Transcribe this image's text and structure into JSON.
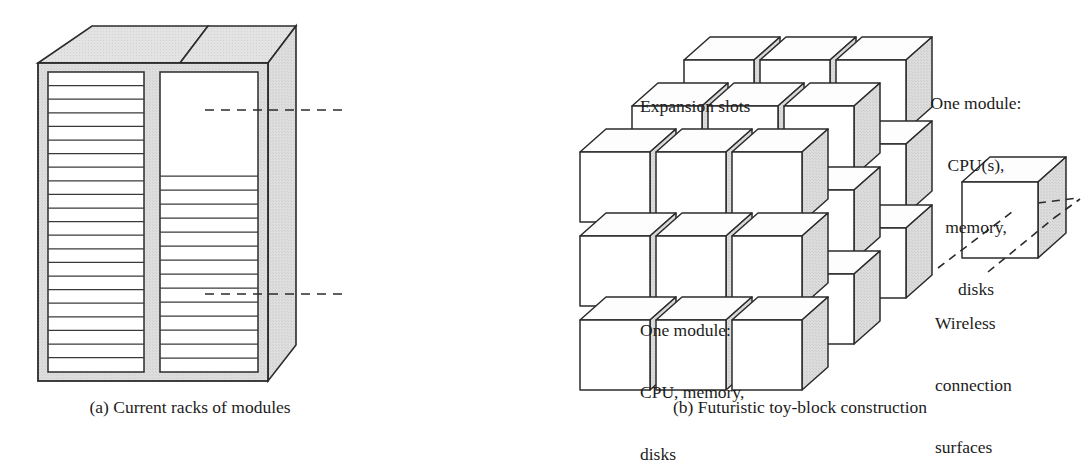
{
  "figure": {
    "panel_a": {
      "caption": "(a) Current racks of modules",
      "callouts": [
        {
          "id": "expansion-slots",
          "text": "Expansion slots"
        },
        {
          "id": "one-module",
          "lines": [
            "One module:",
            "CPU, memory,",
            "disks"
          ]
        }
      ],
      "rack": {
        "bays": 2,
        "left_bay_slot_count": 22,
        "right_bay_slot_count": 13,
        "right_bay_open_area": true
      }
    },
    "panel_b": {
      "caption": "(b) Futuristic toy-block construction",
      "callouts": [
        {
          "id": "one-module",
          "lines": [
            "One module:",
            "CPU(s),",
            "memory,",
            "disks"
          ]
        },
        {
          "id": "wireless",
          "lines": [
            "Wireless",
            "connection",
            "surfaces"
          ]
        }
      ],
      "block_array": {
        "columns": 3,
        "rows": 3,
        "depth": 3,
        "total_blocks": 27
      },
      "sample_block": {
        "faces": [
          "top",
          "front",
          "right"
        ]
      }
    },
    "colors": {
      "ink": "#1c1c1c",
      "outline": "#2b2b2b",
      "panel_fill": "#ffffff",
      "shade_fill": "#d9d9d9",
      "shade_fill_light": "#e6e6e6",
      "background": "#ffffff"
    }
  }
}
